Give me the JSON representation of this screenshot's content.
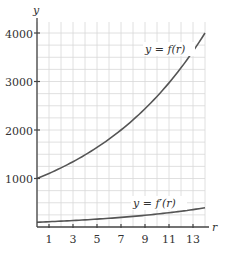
{
  "chart_data": {
    "type": "line",
    "title": "",
    "xlabel": "r",
    "ylabel": "y",
    "xlim": [
      0,
      14
    ],
    "ylim": [
      0,
      4200
    ],
    "x_ticks": [
      1,
      3,
      5,
      7,
      9,
      11,
      13
    ],
    "y_ticks": [
      1000,
      2000,
      3000,
      4000
    ],
    "grid": true,
    "grid_x_step": 1,
    "grid_y_step": 250,
    "x": [
      0,
      1,
      2,
      3,
      4,
      5,
      6,
      7,
      8,
      9,
      10,
      11,
      12,
      13,
      14
    ],
    "series": [
      {
        "name": "y = f(r)",
        "values": [
          1000,
          1104,
          1219,
          1346,
          1486,
          1641,
          1811,
          2000,
          2208,
          2438,
          2692,
          2972,
          3281,
          3623,
          4000
        ]
      },
      {
        "name": "y = f'(r)",
        "values": [
          99,
          109,
          121,
          133,
          147,
          163,
          179,
          198,
          219,
          242,
          267,
          294,
          325,
          359,
          396
        ]
      }
    ],
    "annotations": [
      {
        "text": "y = f(r)",
        "x": 10.5,
        "y": 3600
      },
      {
        "text": "y = f'(r)",
        "x": 10.5,
        "y": 420
      }
    ]
  },
  "labels": {
    "y_axis": "y",
    "x_axis": "r",
    "f_curve": "y = f(r)",
    "fprime_curve": "y = f′(r)",
    "x_ticks": [
      "1",
      "3",
      "5",
      "7",
      "9",
      "11",
      "13"
    ],
    "y_ticks": [
      "1000",
      "2000",
      "3000",
      "4000"
    ]
  },
  "colors": {
    "grid": "#d8d8d8",
    "axis": "#444444",
    "curve": "#555555"
  }
}
